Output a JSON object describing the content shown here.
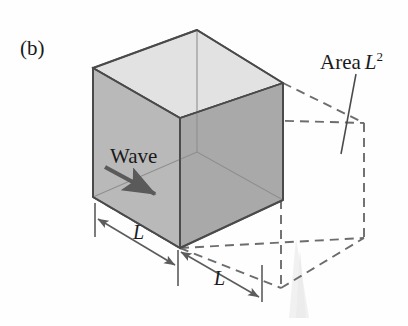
{
  "figure": {
    "panel_label": "(b)",
    "caption_kind": "physics-diagram-cube-wave-flux",
    "labels": {
      "area_text": "Area",
      "area_symbol": "L",
      "area_exponent": "2",
      "wave": "Wave",
      "dimension_front": "L",
      "dimension_depth": "L"
    },
    "colors": {
      "background": "#fefefe",
      "ink": "#1a1a1a",
      "top_face": "#e2e2e2",
      "left_face": "#b9b9b9",
      "right_face": "#a9a9a9",
      "inner_floor": "#cfcfcf",
      "edge": "#4a4a4a",
      "dashed": "#6d6d6d",
      "dimension_line": "#5c5c5c",
      "arrow": "#5a5a5a",
      "watermark": "#f2f2f2"
    },
    "geometry": {
      "cube_vertices": {
        "back_top": [
          197,
          30
        ],
        "left_top": [
          93,
          68
        ],
        "right_top": [
          283,
          83
        ],
        "front_top": [
          180,
          118
        ],
        "left_bottom": [
          93,
          197
        ],
        "right_bottom": [
          283,
          200
        ],
        "front_bottom": [
          180,
          248
        ]
      },
      "projected_face": {
        "far_top_right": [
          364,
          123
        ],
        "far_bottom_right": [
          364,
          238
        ],
        "far_mid_right": [
          283,
          200
        ],
        "floor_far": [
          281,
          288
        ]
      },
      "wave_arrow": {
        "from": [
          105,
          167
        ],
        "to": [
          158,
          196
        ]
      },
      "leader_line": {
        "from": [
          356,
          74
        ],
        "to": [
          342,
          153
        ]
      },
      "dim_front": {
        "x1": 95,
        "x2": 178,
        "y1": 208,
        "y2": 247
      },
      "dim_depth": {
        "x1": 178,
        "x2": 262,
        "y1": 252,
        "y2": 292
      }
    }
  }
}
